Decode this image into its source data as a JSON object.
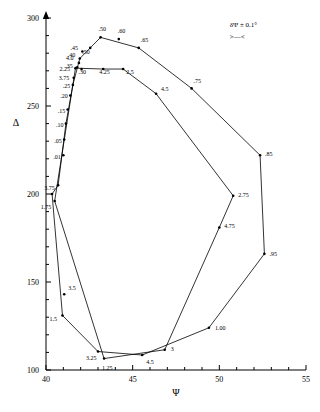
{
  "chart_data": {
    "type": "scatter",
    "title": "",
    "xlabel": "Ψ",
    "ylabel": "Δ",
    "xlim": [
      40,
      55
    ],
    "ylim": [
      100,
      300
    ],
    "xticks": [
      40,
      45,
      50,
      55
    ],
    "xticklabels": [
      "40",
      "45",
      "50",
      "55"
    ],
    "yticks": [
      100,
      150,
      200,
      250,
      300
    ],
    "yticklabels": [
      "100",
      "150",
      "200",
      "250",
      "300"
    ],
    "grid": false,
    "legend": null,
    "annotations": [
      {
        "id": "error-note",
        "text": "δΨ ± 0.1°",
        "x": 50.6,
        "y": 295
      },
      {
        "id": "error-bar-marker",
        "text": ">—<",
        "x": 50.6,
        "y": 288
      }
    ],
    "series": [
      {
        "name": "film thickness locus",
        "points": [
          {
            "label": "",
            "x": 40.35,
            "y": 200.0
          },
          {
            "label": "1.75",
            "x": 40.5,
            "y": 196.0
          },
          {
            "label": "1.5",
            "x": 40.95,
            "y": 131.0
          },
          {
            "label": "3.5",
            "x": 41.05,
            "y": 143.0
          },
          {
            "label": "3.25",
            "x": 43.0,
            "y": 110.5
          },
          {
            "label": "1.25",
            "x": 43.35,
            "y": 106.5
          },
          {
            "label": "4.5",
            "x": 45.55,
            "y": 108.5
          },
          {
            "label": "3",
            "x": 46.85,
            "y": 111.5
          },
          {
            "label": "1.00",
            "x": 49.4,
            "y": 124.0
          },
          {
            "label": ".95",
            "x": 52.6,
            "y": 166.0
          },
          {
            "label": "4.75",
            "x": 50.0,
            "y": 181.0
          },
          {
            "label": "2.75",
            "x": 50.8,
            "y": 199.0
          },
          {
            "label": ".85",
            "x": 52.35,
            "y": 222.0
          },
          {
            "label": ".75",
            "x": 48.4,
            "y": 260.0
          },
          {
            "label": "4.5",
            "x": 46.35,
            "y": 257.0
          },
          {
            "label": ".65",
            "x": 45.35,
            "y": 283.0
          },
          {
            "label": ".60",
            "x": 44.2,
            "y": 288.0
          },
          {
            "label": ".50",
            "x": 43.15,
            "y": 289.0
          },
          {
            "label": "2.5",
            "x": 44.45,
            "y": 271.0
          },
          {
            "label": "4.25",
            "x": 43.3,
            "y": 271.0
          },
          {
            "label": ".50",
            "x": 42.55,
            "y": 283.0
          },
          {
            "label": ".45",
            "x": 42.1,
            "y": 281.0
          },
          {
            "label": ".40",
            "x": 41.95,
            "y": 277.0
          },
          {
            "label": ".35",
            "x": 41.8,
            "y": 272.0
          },
          {
            "label": ".30",
            "x": 42.05,
            "y": 271.0
          },
          {
            "label": "2.25",
            "x": 41.7,
            "y": 271.5
          },
          {
            "label": "4.0",
            "x": 41.9,
            "y": 274.5
          },
          {
            "label": "3.75",
            "x": 41.6,
            "y": 266.0
          },
          {
            "label": ".25",
            "x": 41.55,
            "y": 262.0
          },
          {
            "label": ".20",
            "x": 41.4,
            "y": 256.0
          },
          {
            "label": ".15",
            "x": 41.25,
            "y": 248.0
          },
          {
            "label": ".10",
            "x": 41.15,
            "y": 240.0
          },
          {
            "label": ".05",
            "x": 41.05,
            "y": 231.0
          },
          {
            "label": ".01",
            "x": 41.0,
            "y": 222.0
          },
          {
            "label": "3.75",
            "x": 40.7,
            "y": 205.0
          }
        ]
      }
    ],
    "paths": [
      {
        "id": "outer-loop",
        "xy": [
          [
            40.35,
            200.0
          ],
          [
            40.95,
            131.0
          ],
          [
            43.0,
            110.5
          ],
          [
            45.55,
            108.5
          ],
          [
            49.4,
            124.0
          ],
          [
            52.6,
            166.0
          ],
          [
            52.35,
            222.0
          ],
          [
            48.4,
            260.0
          ],
          [
            45.35,
            283.0
          ],
          [
            43.15,
            289.0
          ],
          [
            41.95,
            277.0
          ],
          [
            41.55,
            262.0
          ],
          [
            41.15,
            240.0
          ],
          [
            40.7,
            205.0
          ],
          [
            40.35,
            200.0
          ]
        ]
      },
      {
        "id": "inner-loop",
        "xy": [
          [
            41.7,
            271.5
          ],
          [
            43.3,
            271.0
          ],
          [
            44.45,
            271.0
          ],
          [
            46.35,
            257.0
          ],
          [
            50.8,
            199.0
          ],
          [
            50.0,
            181.0
          ],
          [
            46.85,
            111.5
          ],
          [
            43.35,
            106.5
          ],
          [
            40.5,
            196.0
          ],
          [
            41.7,
            271.5
          ]
        ]
      }
    ]
  },
  "axes": {
    "x_title": "Ψ",
    "y_title": "Δ"
  }
}
